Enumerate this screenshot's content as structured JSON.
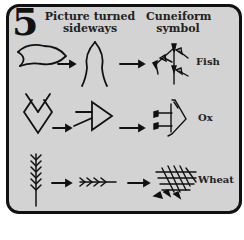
{
  "figure": {
    "number": "5",
    "headers": {
      "picture": "Picture turned sideways",
      "picture_line1": "Picture turned",
      "picture_line2": "sideways",
      "cuneiform": "Cuneiform symbol",
      "cuneiform_line1": "Cuneiform",
      "cuneiform_line2": "symbol"
    },
    "rows": [
      {
        "label": "Fish",
        "stages": [
          "pictograph",
          "rotated pictograph",
          "cuneiform"
        ]
      },
      {
        "label": "Ox",
        "stages": [
          "pictograph",
          "rotated pictograph",
          "cuneiform"
        ]
      },
      {
        "label": "Wheat",
        "stages": [
          "pictograph",
          "rotated pictograph",
          "cuneiform"
        ]
      }
    ],
    "colors": {
      "panel": "#d3d3d3",
      "ink": "#111111",
      "border": "#111111"
    }
  }
}
